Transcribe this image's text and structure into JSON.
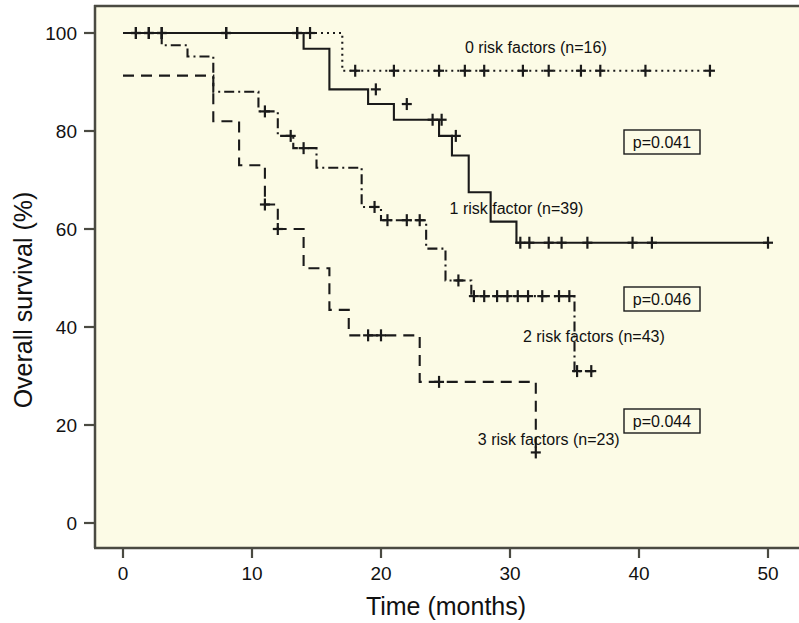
{
  "figure": {
    "background": "#ffffff",
    "plot_background": "#FCFBE6",
    "frame_color": "#4a4a42"
  },
  "axes": {
    "x": {
      "title": "Time (months)",
      "ticks": [
        "0",
        "10",
        "20",
        "30",
        "40",
        "50"
      ],
      "range": [
        -2,
        52
      ]
    },
    "y": {
      "title": "Overall survival (%)",
      "ticks": [
        "0",
        "20",
        "40",
        "60",
        "80",
        "100"
      ],
      "range": [
        -6,
        106
      ]
    }
  },
  "annotations": {
    "p_values": [
      {
        "text": "p=0.041"
      },
      {
        "text": "p=0.046"
      },
      {
        "text": "p=0.044"
      }
    ]
  },
  "chart_data": {
    "type": "line",
    "title": "",
    "xlabel": "Time (months)",
    "ylabel": "Overall survival (%)",
    "xlim": [
      -2,
      52
    ],
    "ylim": [
      -6,
      106
    ],
    "grid": false,
    "legend_position": "inline-labels",
    "plot_kind": "kaplan-meier-survival",
    "series": [
      {
        "name": "0 risk factors (n=16)",
        "label": "0 risk factors (n=16)",
        "n": 16,
        "linestyle": "dotted",
        "color": "#1a1a1a",
        "label_x": 32.0,
        "label_y": 96.0,
        "steps": [
          [
            0,
            100
          ],
          [
            17.0,
            100
          ],
          [
            17.0,
            92.3
          ],
          [
            45.5,
            92.3
          ]
        ],
        "censored": [
          [
            1.0,
            100
          ],
          [
            2.0,
            100
          ],
          [
            3.0,
            100
          ],
          [
            8.0,
            100
          ],
          [
            13.5,
            100
          ],
          [
            14.5,
            100
          ],
          [
            18.0,
            92.3
          ],
          [
            21.0,
            92.3
          ],
          [
            24.5,
            92.3
          ],
          [
            26.5,
            92.3
          ],
          [
            28.0,
            92.3
          ],
          [
            31.0,
            92.3
          ],
          [
            33.0,
            92.3
          ],
          [
            35.5,
            92.3
          ],
          [
            37.0,
            92.3
          ],
          [
            40.5,
            92.3
          ],
          [
            45.5,
            92.3
          ]
        ]
      },
      {
        "name": "1 risk factor (n=39)",
        "label": "1 risk factor (n=39)",
        "n": 39,
        "linestyle": "solid",
        "color": "#1a1a1a",
        "label_x": 30.5,
        "label_y": 63.0,
        "steps": [
          [
            0,
            100
          ],
          [
            14.0,
            100
          ],
          [
            14.0,
            96.8
          ],
          [
            16.0,
            96.8
          ],
          [
            16.0,
            88.5
          ],
          [
            19.0,
            88.5
          ],
          [
            19.0,
            85.5
          ],
          [
            21.0,
            85.5
          ],
          [
            21.0,
            82.3
          ],
          [
            24.5,
            82.3
          ],
          [
            24.5,
            79.0
          ],
          [
            25.5,
            79.0
          ],
          [
            25.5,
            75.0
          ],
          [
            26.8,
            75.0
          ],
          [
            26.8,
            67.5
          ],
          [
            28.5,
            67.5
          ],
          [
            28.5,
            61.5
          ],
          [
            30.5,
            61.5
          ],
          [
            30.5,
            57.2
          ],
          [
            50.0,
            57.2
          ]
        ],
        "censored": [
          [
            1.0,
            100
          ],
          [
            2.0,
            100
          ],
          [
            3.0,
            100
          ],
          [
            8.0,
            100
          ],
          [
            13.5,
            100
          ],
          [
            19.6,
            88.5
          ],
          [
            22.0,
            85.5
          ],
          [
            24.0,
            82.3
          ],
          [
            24.7,
            82.3
          ],
          [
            25.8,
            79.0
          ],
          [
            30.8,
            57.2
          ],
          [
            31.5,
            57.2
          ],
          [
            33.0,
            57.2
          ],
          [
            34.0,
            57.2
          ],
          [
            36.0,
            57.2
          ],
          [
            39.5,
            57.2
          ],
          [
            41.0,
            57.2
          ],
          [
            50.0,
            57.2
          ]
        ]
      },
      {
        "name": "2 risk factors (n=43)",
        "label": "2 risk factors (n=43)",
        "n": 43,
        "linestyle": "dashdot",
        "color": "#1a1a1a",
        "label_x": 36.5,
        "label_y": 37.0,
        "steps": [
          [
            0,
            100
          ],
          [
            3.0,
            100
          ],
          [
            3.0,
            97.5
          ],
          [
            5.0,
            97.5
          ],
          [
            5.0,
            95.2
          ],
          [
            7.0,
            95.2
          ],
          [
            7.0,
            88.0
          ],
          [
            10.5,
            88.0
          ],
          [
            10.5,
            84.0
          ],
          [
            12.0,
            84.0
          ],
          [
            12.0,
            79.0
          ],
          [
            13.2,
            79.0
          ],
          [
            13.2,
            76.5
          ],
          [
            15.0,
            76.5
          ],
          [
            15.0,
            72.5
          ],
          [
            18.5,
            72.5
          ],
          [
            18.5,
            64.5
          ],
          [
            20.0,
            64.5
          ],
          [
            20.0,
            61.8
          ],
          [
            23.5,
            61.8
          ],
          [
            23.5,
            56.0
          ],
          [
            25.0,
            56.0
          ],
          [
            25.0,
            49.5
          ],
          [
            27.0,
            49.5
          ],
          [
            27.0,
            46.3
          ],
          [
            35.0,
            46.3
          ],
          [
            35.0,
            31.0
          ],
          [
            36.5,
            31.0
          ]
        ],
        "censored": [
          [
            11.0,
            84.0
          ],
          [
            13.0,
            79.0
          ],
          [
            14.0,
            76.5
          ],
          [
            19.5,
            64.5
          ],
          [
            20.5,
            61.8
          ],
          [
            22.0,
            61.8
          ],
          [
            23.0,
            61.8
          ],
          [
            26.0,
            49.5
          ],
          [
            27.2,
            46.3
          ],
          [
            28.0,
            46.3
          ],
          [
            29.0,
            46.3
          ],
          [
            29.8,
            46.3
          ],
          [
            30.6,
            46.3
          ],
          [
            31.4,
            46.3
          ],
          [
            32.5,
            46.3
          ],
          [
            33.8,
            46.3
          ],
          [
            34.6,
            46.3
          ],
          [
            35.2,
            31.0
          ],
          [
            36.3,
            31.0
          ]
        ]
      },
      {
        "name": "3 risk factors (n=23)",
        "label": "3 risk factors (n=23)",
        "n": 23,
        "linestyle": "dashed",
        "color": "#1a1a1a",
        "label_x": 33.0,
        "label_y": 16.0,
        "steps": [
          [
            0,
            91.3
          ],
          [
            7.0,
            91.3
          ],
          [
            7.0,
            82.0
          ],
          [
            9.0,
            82.0
          ],
          [
            9.0,
            73.0
          ],
          [
            11.0,
            73.0
          ],
          [
            11.0,
            65.0
          ],
          [
            12.0,
            65.0
          ],
          [
            12.0,
            60.0
          ],
          [
            14.0,
            60.0
          ],
          [
            14.0,
            52.0
          ],
          [
            16.0,
            52.0
          ],
          [
            16.0,
            43.5
          ],
          [
            17.5,
            43.5
          ],
          [
            17.5,
            38.3
          ],
          [
            23.0,
            38.3
          ],
          [
            23.0,
            28.8
          ],
          [
            32.0,
            28.8
          ],
          [
            32.0,
            14.4
          ]
        ],
        "censored": [
          [
            11.0,
            65.0
          ],
          [
            12.0,
            60.0
          ],
          [
            19.0,
            38.3
          ],
          [
            20.0,
            38.3
          ],
          [
            24.5,
            28.8
          ],
          [
            32.0,
            14.4
          ]
        ]
      }
    ]
  }
}
